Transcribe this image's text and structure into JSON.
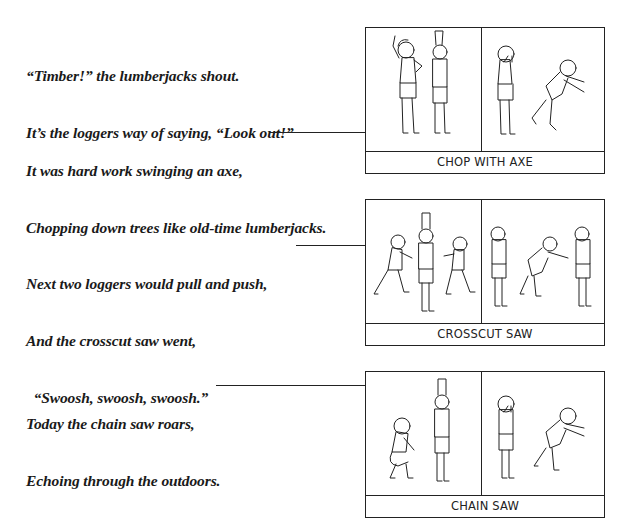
{
  "verses": [
    {
      "id": "timber",
      "lines": [
        "“Timber!” the lumberjacks shout.",
        "It’s the loggers way of saying, “Look out!”"
      ]
    },
    {
      "id": "axe",
      "lines": [
        "It was hard work swinging an axe,",
        "Chopping down trees like old-time lumberjacks."
      ]
    },
    {
      "id": "crosscut",
      "lines": [
        "Next two loggers would pull and push,",
        "And the crosscut saw went,",
        "  “Swoosh, swoosh, swoosh.”"
      ]
    },
    {
      "id": "chainsaw",
      "lines": [
        "Today the chain saw roars,",
        "Echoing through the outdoors."
      ]
    }
  ],
  "panels": [
    {
      "id": "chop-with-axe",
      "caption": "CHOP WITH AXE"
    },
    {
      "id": "crosscut-saw",
      "caption": "CROSSCUT SAW"
    },
    {
      "id": "chain-saw",
      "caption": "CHAIN SAW"
    }
  ]
}
